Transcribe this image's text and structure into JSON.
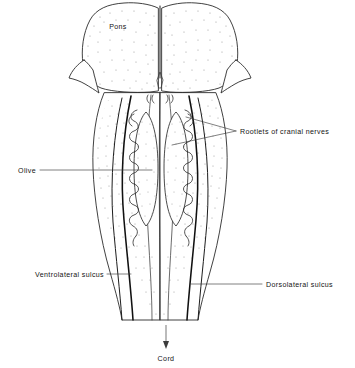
{
  "figure": {
    "style": "black-and-white stippled line drawing",
    "background_color": "#ffffff",
    "line_color": "#2b2b2b",
    "stipple_color": "#9a9a9a"
  },
  "labels": {
    "pons": {
      "text": "Pons",
      "x": 118,
      "y": 29,
      "anchor": "middle",
      "has_leader": false
    },
    "rootlets": {
      "text": "Rootlets of cranial nerves",
      "x": 240,
      "y": 132,
      "anchor": "start",
      "has_leader": true
    },
    "olive": {
      "text": "Olive",
      "x": 36,
      "y": 172,
      "anchor": "end",
      "has_leader": true
    },
    "ventrolateral_sulcus": {
      "text": "Ventrolateral sulcus",
      "x": 104,
      "y": 276,
      "anchor": "end",
      "has_leader": true
    },
    "dorsolateral_sulcus": {
      "text": "Dorsolateral sulcus",
      "x": 266,
      "y": 286,
      "anchor": "start",
      "has_leader": true
    },
    "cord": {
      "text": "Cord",
      "x": 166,
      "y": 360,
      "anchor": "middle",
      "has_leader": false
    }
  },
  "structures": [
    {
      "name": "pons",
      "description": "rounded bilateral swelling at top with basilar groove"
    },
    {
      "name": "median-fissure",
      "description": "thin vertical midline groove"
    },
    {
      "name": "olive-left",
      "description": "oval elevation lateral to pyramid"
    },
    {
      "name": "olive-right",
      "description": "oval elevation lateral to pyramid"
    },
    {
      "name": "rootlet-column-left",
      "description": "serpentine nerve rootlets"
    },
    {
      "name": "rootlet-column-right",
      "description": "serpentine nerve rootlets"
    },
    {
      "name": "medulla",
      "description": "tapering body narrowing inferiorly into spinal cord"
    },
    {
      "name": "cerebellar-peduncle-left",
      "description": "pointed lateral flange"
    },
    {
      "name": "cerebellar-peduncle-right",
      "description": "pointed lateral flange"
    }
  ],
  "arrow": {
    "name": "cord-direction-arrow",
    "from_x": 166,
    "from_y": 325,
    "to_x": 166,
    "to_y": 348,
    "direction": "down"
  }
}
